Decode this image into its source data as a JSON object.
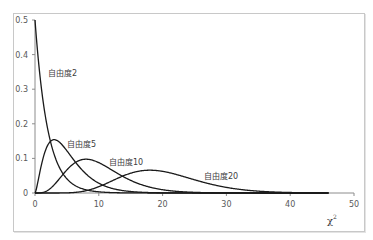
{
  "chart_data": {
    "type": "line",
    "title": "",
    "xlabel": "χ",
    "xlabel_sup": "2",
    "ylabel": "",
    "xlim": [
      0,
      50
    ],
    "ylim": [
      0,
      0.5
    ],
    "x_ticks": [
      "0",
      "10",
      "20",
      "30",
      "40",
      "50"
    ],
    "y_ticks": [
      "0",
      "0.1",
      "0.2",
      "0.3",
      "0.4",
      "0.5"
    ],
    "grid": false,
    "legend": "none (inline labels)",
    "series": [
      {
        "name": "自由度2",
        "df": 2,
        "peak_x": 0,
        "peak_y": 0.5,
        "x": [
          0,
          1,
          2,
          3,
          4,
          5,
          6,
          8,
          10,
          15
        ],
        "values": [
          0.5,
          0.303,
          0.184,
          0.112,
          0.068,
          0.041,
          0.025,
          0.009,
          0.003,
          0.0003
        ]
      },
      {
        "name": "自由度5",
        "df": 5,
        "peak_x": 3,
        "peak_y": 0.154,
        "x": [
          0,
          1,
          2,
          3,
          4,
          5,
          6,
          8,
          10,
          15,
          20
        ],
        "values": [
          0,
          0.081,
          0.138,
          0.154,
          0.144,
          0.122,
          0.097,
          0.055,
          0.028,
          0.004,
          0.0005
        ]
      },
      {
        "name": "自由度10",
        "df": 10,
        "peak_x": 8,
        "peak_y": 0.098,
        "x": [
          0,
          2,
          4,
          6,
          8,
          10,
          12,
          15,
          20,
          25,
          30
        ],
        "values": [
          0,
          0.008,
          0.045,
          0.084,
          0.098,
          0.088,
          0.067,
          0.038,
          0.009,
          0.002,
          0.0003
        ]
      },
      {
        "name": "自由度20",
        "df": 20,
        "peak_x": 18,
        "peak_y": 0.066,
        "x": [
          0,
          5,
          10,
          15,
          18,
          20,
          25,
          30,
          35,
          40,
          45
        ],
        "values": [
          0,
          0.0005,
          0.009,
          0.049,
          0.066,
          0.063,
          0.038,
          0.013,
          0.003,
          0.0005,
          0.0001
        ]
      }
    ]
  },
  "labels": {
    "s2": "自由度2",
    "s5": "自由度5",
    "s10": "自由度10",
    "s20": "自由度20",
    "xlabel": "χ",
    "xlabel_sup": "2"
  },
  "ticks": {
    "x0": "0",
    "x10": "10",
    "x20": "20",
    "x30": "30",
    "x40": "40",
    "x50": "50",
    "y0": "0",
    "y1": "0.1",
    "y2": "0.2",
    "y3": "0.3",
    "y4": "0.4",
    "y5": "0.5"
  }
}
